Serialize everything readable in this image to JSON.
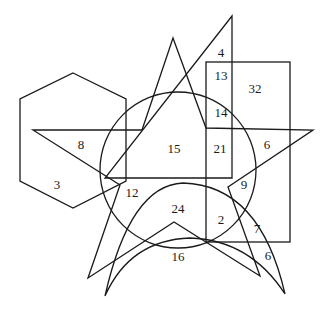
{
  "diagram": {
    "colors": {
      "stroke": "#1a1a1a",
      "background": "#ffffff"
    },
    "shapes": {
      "hexagon": {
        "points": "73,73 126,99 126,181 73,208 20,181 20,99"
      },
      "circle": {
        "cx": 178,
        "cy": 170,
        "r": 78
      },
      "star": {
        "points": "173,38 206,128 313,130 228,187 260,276 174,222 88,278 120,185 33,130 142,130"
      },
      "right_triangle": {
        "points": "232,16 232,178 105,178"
      },
      "rectangle": {
        "x": 206,
        "y": 62,
        "width": 84,
        "height": 180
      },
      "crescent": {
        "d": "M 105,296 Q 130,185 183,183 Q 260,185 285,294 Q 250,240 190,238 Q 130,240 105,296 Z"
      }
    },
    "labels": [
      {
        "text": "4",
        "x": 221,
        "y": 54
      },
      {
        "text": "13",
        "x": 221,
        "y": 77
      },
      {
        "text": "32",
        "x": 255,
        "y": 90
      },
      {
        "text": "14",
        "x": 221,
        "y": 114
      },
      {
        "text": "8",
        "x": 81,
        "y": 146
      },
      {
        "text": "15",
        "x": 174,
        "y": 150
      },
      {
        "text": "21",
        "x": 220,
        "y": 150
      },
      {
        "text": "6",
        "x": 267,
        "y": 146
      },
      {
        "text": "3",
        "x": 57,
        "y": 186
      },
      {
        "text": "9",
        "x": 244,
        "y": 186
      },
      {
        "text": "12",
        "x": 132,
        "y": 194
      },
      {
        "text": "24",
        "x": 178,
        "y": 210
      },
      {
        "text": "2",
        "x": 221,
        "y": 221
      },
      {
        "text": "7",
        "x": 257,
        "y": 230
      },
      {
        "text": "16",
        "x": 178,
        "y": 258
      },
      {
        "text": "6",
        "x": 268,
        "y": 257
      }
    ]
  }
}
